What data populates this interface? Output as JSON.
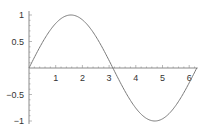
{
  "chart_data": {
    "type": "line",
    "title": "",
    "xlabel": "",
    "ylabel": "",
    "function": "sin(x)",
    "xlim": [
      0,
      6.2832
    ],
    "ylim": [
      -1,
      1
    ],
    "grid": false,
    "legend": null,
    "x_ticks": [
      1,
      2,
      3,
      4,
      5,
      6
    ],
    "x_tick_labels": [
      "1",
      "2",
      "3",
      "4",
      "5",
      "6"
    ],
    "y_ticks": [
      1,
      0.5,
      -0.5,
      -1
    ],
    "y_tick_labels": [
      "1",
      "0.5",
      "-0.5",
      "-1"
    ],
    "series": [
      {
        "name": "sin(x)",
        "color": "#7a7a7a",
        "x": [
          0,
          0.3927,
          0.7854,
          1.1781,
          1.5708,
          1.9635,
          2.3562,
          2.7489,
          3.1416,
          3.5343,
          3.927,
          4.3197,
          4.7124,
          5.1051,
          5.4978,
          5.8905,
          6.2832
        ],
        "y": [
          0,
          0.3827,
          0.7071,
          0.9239,
          1,
          0.9239,
          0.7071,
          0.3827,
          0,
          -0.3827,
          -0.7071,
          -0.9239,
          -1,
          -0.9239,
          -0.7071,
          -0.3827,
          0
        ]
      }
    ]
  },
  "colors": {
    "axis": "#8a8a8a",
    "curve": "#7a7a7a",
    "label": "#333333",
    "background": "#ffffff"
  }
}
